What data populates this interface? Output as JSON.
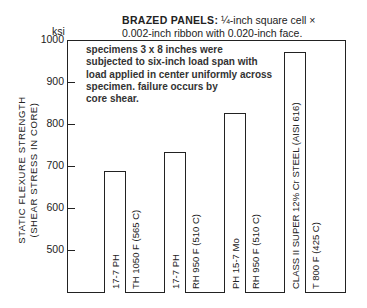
{
  "chart_data": {
    "type": "bar",
    "title_bold": "BRAZED PANELS:",
    "title_rest_line1": "¼-inch square cell ×",
    "title_line2": "0.002-inch ribbon with 0.020-inch face.",
    "ylabel": "STATIC FLEXURE STRENGTH",
    "ylabel2": "(SHEAR STRESS IN CORE)",
    "yunit": "ksi",
    "ylim": [
      400,
      1000
    ],
    "yticks": [
      1000,
      900,
      800,
      700,
      600,
      500
    ],
    "grid": false,
    "annotation": "specimens 3 x 8 inches were subjected to six-inch load span with load applied in center uniformly across specimen. failure occurs by core shear.",
    "annotation_lines": [
      "specimens 3 x 8 inches were",
      "subjected to six-inch load span with",
      "load applied in center uniformly across",
      "specimen. failure occurs by",
      "core shear."
    ],
    "categories": [
      "17-7 PH TH 1050 F (565 C)",
      "17-7 PH RH 950 F (510 C)",
      "PH 15-7 Mo RH 950 F (510 C)",
      "CLASS II SUPER 12% Cr STEEL (AISI 616) T 800 F (425 C)"
    ],
    "bar_labels": [
      {
        "inside": "17-7 PH",
        "outside": "TH 1050 F (565 C)"
      },
      {
        "inside": "17-7 PH",
        "outside": "RH 950 F (510 C)"
      },
      {
        "inside": "PH 15-7 Mo",
        "outside": "RH 950 F (510 C)"
      },
      {
        "inside": "CLASS II SUPER 12% Cr STEEL (AISI 616)",
        "outside": "T 800 F (425 C)"
      }
    ],
    "values": [
      688,
      733,
      826,
      971
    ]
  }
}
